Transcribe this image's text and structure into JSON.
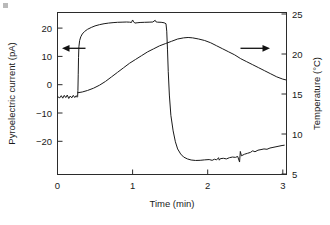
{
  "figure": {
    "background_color": "#ffffff",
    "line_color": "#1a1a1a",
    "corner_mark_color": "#b9b9b9"
  },
  "chart_data": {
    "type": "line",
    "title": "",
    "xlabel": "Time (min)",
    "ylabel": "Pyroelectric current (pA)",
    "y2label": "Temperature (°C)",
    "xlim": [
      0,
      3.05
    ],
    "ylim": [
      -25,
      27
    ],
    "y2lim": [
      4.2,
      25.6
    ],
    "xticks": [
      0,
      1,
      2,
      3
    ],
    "xtick_labels": [
      "0",
      "1",
      "2",
      "3"
    ],
    "yticks": [
      20,
      10,
      0,
      -10,
      -20
    ],
    "ytick_labels": [
      "20",
      "10",
      "0",
      "−10",
      "−20"
    ],
    "y2ticks": [
      25,
      20,
      15,
      10,
      5
    ],
    "y2tick_labels": [
      "25",
      "20",
      "15",
      "10",
      "5"
    ],
    "grid": false,
    "legend": "none",
    "annotations": [
      {
        "name": "left-axis-arrow",
        "direction": "left",
        "points_to": "Pyroelectric current (pA)",
        "x_data": 0.35,
        "y_data": 14.0
      },
      {
        "name": "right-axis-arrow",
        "direction": "right",
        "points_to": "Temperature (°C)",
        "x_data": 2.47,
        "y_data": 14.0
      }
    ],
    "series": [
      {
        "name": "Pyroelectric current",
        "axis": "left",
        "units": "pA",
        "points": [
          [
            0.0,
            0.0
          ],
          [
            0.03,
            -0.4
          ],
          [
            0.05,
            0.3
          ],
          [
            0.07,
            -0.5
          ],
          [
            0.09,
            0.4
          ],
          [
            0.11,
            -0.3
          ],
          [
            0.13,
            0.5
          ],
          [
            0.15,
            -0.6
          ],
          [
            0.17,
            0.2
          ],
          [
            0.19,
            -0.4
          ],
          [
            0.21,
            0.4
          ],
          [
            0.23,
            -0.3
          ],
          [
            0.25,
            0.3
          ],
          [
            0.262,
            -0.2
          ],
          [
            0.268,
            0.0
          ],
          [
            0.272,
            2.0
          ],
          [
            0.276,
            7.0
          ],
          [
            0.28,
            12.5
          ],
          [
            0.285,
            16.0
          ],
          [
            0.295,
            18.0
          ],
          [
            0.31,
            19.2
          ],
          [
            0.33,
            20.1
          ],
          [
            0.36,
            20.9
          ],
          [
            0.4,
            21.6
          ],
          [
            0.45,
            22.2
          ],
          [
            0.5,
            22.7
          ],
          [
            0.56,
            23.1
          ],
          [
            0.62,
            23.4
          ],
          [
            0.68,
            23.6
          ],
          [
            0.74,
            23.75
          ],
          [
            0.8,
            23.85
          ],
          [
            0.86,
            23.9
          ],
          [
            0.92,
            23.95
          ],
          [
            0.96,
            23.9
          ],
          [
            0.985,
            23.8
          ],
          [
            1.0,
            24.6
          ],
          [
            1.015,
            24.0
          ],
          [
            1.03,
            23.6
          ],
          [
            1.06,
            23.7
          ],
          [
            1.1,
            23.8
          ],
          [
            1.16,
            23.85
          ],
          [
            1.22,
            23.9
          ],
          [
            1.27,
            23.95
          ],
          [
            1.3,
            24.5
          ],
          [
            1.315,
            23.95
          ],
          [
            1.33,
            23.9
          ],
          [
            1.38,
            23.85
          ],
          [
            1.42,
            23.7
          ],
          [
            1.445,
            23.4
          ],
          [
            1.455,
            21.0
          ],
          [
            1.465,
            15.0
          ],
          [
            1.475,
            8.0
          ],
          [
            1.49,
            0.5
          ],
          [
            1.51,
            -6.0
          ],
          [
            1.54,
            -11.0
          ],
          [
            1.57,
            -14.5
          ],
          [
            1.6,
            -16.8
          ],
          [
            1.64,
            -18.4
          ],
          [
            1.68,
            -19.4
          ],
          [
            1.73,
            -20.0
          ],
          [
            1.78,
            -20.35
          ],
          [
            1.84,
            -20.5
          ],
          [
            1.9,
            -20.45
          ],
          [
            1.96,
            -20.3
          ],
          [
            2.02,
            -20.2
          ],
          [
            2.06,
            -20.45
          ],
          [
            2.09,
            -20.1
          ],
          [
            2.12,
            -20.3
          ],
          [
            2.145,
            -19.6
          ],
          [
            2.155,
            -20.4
          ],
          [
            2.17,
            -19.9
          ],
          [
            2.21,
            -19.8
          ],
          [
            2.25,
            -20.0
          ],
          [
            2.29,
            -19.6
          ],
          [
            2.33,
            -19.4
          ],
          [
            2.37,
            -19.5
          ],
          [
            2.4,
            -19.2
          ],
          [
            2.425,
            -21.0
          ],
          [
            2.435,
            -17.6
          ],
          [
            2.45,
            -19.0
          ],
          [
            2.49,
            -18.5
          ],
          [
            2.53,
            -18.2
          ],
          [
            2.57,
            -17.9
          ],
          [
            2.6,
            -17.4
          ],
          [
            2.63,
            -17.7
          ],
          [
            2.67,
            -17.2
          ],
          [
            2.71,
            -17.0
          ],
          [
            2.75,
            -16.8
          ],
          [
            2.79,
            -16.9
          ],
          [
            2.83,
            -16.5
          ],
          [
            2.87,
            -16.3
          ],
          [
            2.91,
            -16.1
          ],
          [
            2.95,
            -15.9
          ],
          [
            2.99,
            -15.7
          ],
          [
            3.02,
            -15.6
          ]
        ]
      },
      {
        "name": "Temperature",
        "axis": "right",
        "units": "°C",
        "points": [
          [
            0.27,
            15.0
          ],
          [
            0.33,
            15.1
          ],
          [
            0.4,
            15.3
          ],
          [
            0.48,
            15.6
          ],
          [
            0.56,
            16.0
          ],
          [
            0.64,
            16.5
          ],
          [
            0.72,
            17.1
          ],
          [
            0.8,
            17.7
          ],
          [
            0.88,
            18.3
          ],
          [
            0.96,
            18.9
          ],
          [
            1.04,
            19.4
          ],
          [
            1.12,
            19.9
          ],
          [
            1.2,
            20.4
          ],
          [
            1.28,
            20.8
          ],
          [
            1.36,
            21.2
          ],
          [
            1.44,
            21.5
          ],
          [
            1.52,
            21.8
          ],
          [
            1.6,
            22.1
          ],
          [
            1.68,
            22.25
          ],
          [
            1.74,
            22.3
          ],
          [
            1.8,
            22.25
          ],
          [
            1.88,
            22.1
          ],
          [
            1.96,
            21.9
          ],
          [
            2.04,
            21.6
          ],
          [
            2.12,
            21.2
          ],
          [
            2.2,
            20.8
          ],
          [
            2.28,
            20.4
          ],
          [
            2.36,
            20.0
          ],
          [
            2.44,
            19.5
          ],
          [
            2.52,
            19.1
          ],
          [
            2.6,
            18.7
          ],
          [
            2.68,
            18.3
          ],
          [
            2.76,
            17.9
          ],
          [
            2.84,
            17.5
          ],
          [
            2.92,
            17.1
          ],
          [
            3.0,
            16.8
          ],
          [
            3.04,
            16.7
          ]
        ]
      }
    ]
  }
}
